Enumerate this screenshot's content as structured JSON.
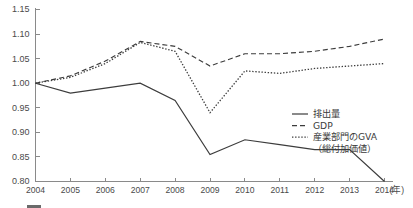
{
  "chart_data": {
    "type": "line",
    "title": "",
    "xlabel": "(年)",
    "ylabel": "",
    "x": [
      2004,
      2005,
      2006,
      2007,
      2008,
      2009,
      2010,
      2011,
      2012,
      2013,
      2014
    ],
    "xtick_labels": [
      "2004",
      "2005",
      "2006",
      "2007",
      "2008",
      "2009",
      "2010",
      "2011",
      "2012",
      "2013",
      "2014"
    ],
    "ytick_labels": [
      "0.80",
      "0.85",
      "0.90",
      "0.95",
      "1.00",
      "1.05",
      "1.10",
      "1.15"
    ],
    "ytick_values": [
      0.8,
      0.85,
      0.9,
      0.95,
      1.0,
      1.05,
      1.1,
      1.15
    ],
    "ylim": [
      0.8,
      1.15
    ],
    "xlim": [
      2004,
      2014
    ],
    "grid": false,
    "legend_position": "center-right",
    "series": [
      {
        "name": "排出量",
        "style": "solid",
        "color": "#3c3c3c",
        "values": [
          1.0,
          0.98,
          0.99,
          1.0,
          0.965,
          0.855,
          0.885,
          0.875,
          0.865,
          0.865,
          0.8
        ]
      },
      {
        "name": "GDP",
        "style": "dashed",
        "color": "#3c3c3c",
        "values": [
          1.0,
          1.015,
          1.045,
          1.085,
          1.075,
          1.035,
          1.06,
          1.06,
          1.065,
          1.075,
          1.09
        ]
      },
      {
        "name": "産業部門のGVA（総付加価値）",
        "style": "dotted",
        "color": "#3c3c3c",
        "values": [
          1.0,
          1.012,
          1.04,
          1.083,
          1.065,
          0.94,
          1.025,
          1.02,
          1.03,
          1.035,
          1.04
        ]
      }
    ]
  },
  "legend": {
    "entries": [
      {
        "label": "排出量",
        "style": "solid"
      },
      {
        "label": "GDP",
        "style": "dashed"
      },
      {
        "label": "産業部門のGVA",
        "style": "dotted"
      },
      {
        "label": "（総付加価値）",
        "style": "none"
      }
    ]
  },
  "axis": {
    "x_unit_label": "(年)"
  },
  "colors": {
    "line": "#3c3c3c",
    "axis": "#8a8a8a",
    "text": "#4a4a4a",
    "background": "#ffffff"
  },
  "footer": {
    "caption": ""
  }
}
